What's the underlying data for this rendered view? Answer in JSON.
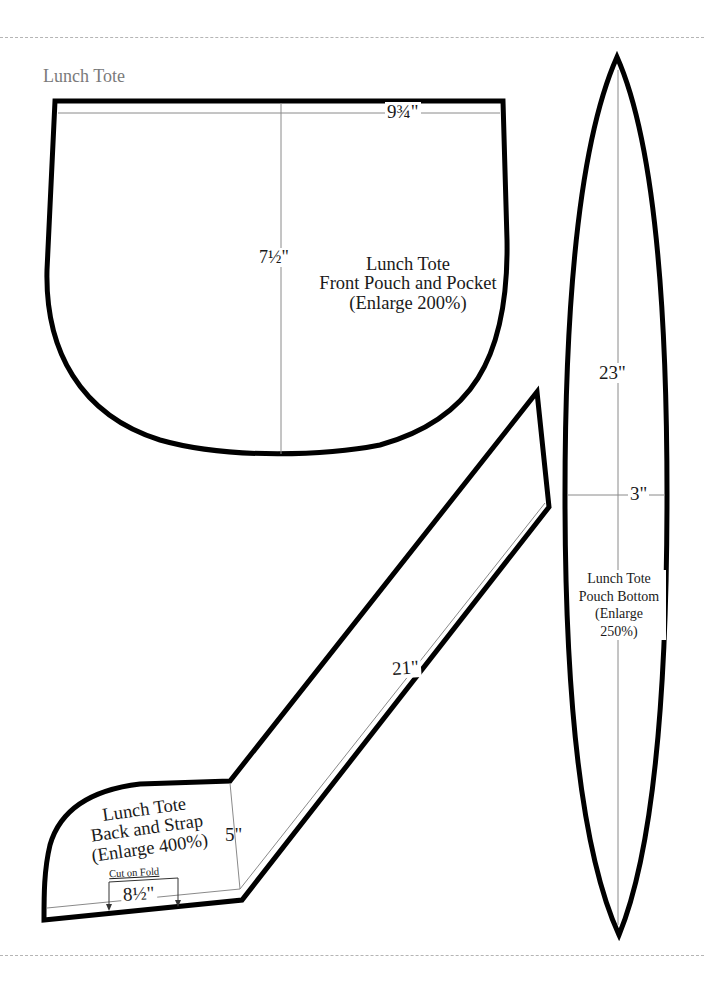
{
  "page": {
    "title": "Lunch Tote",
    "cut_line_color": "#b5b5b5",
    "outline_color": "#000000",
    "guide_line_color": "#8a8a8a"
  },
  "pieces": {
    "front_pouch": {
      "name_line1": "Lunch Tote",
      "name_line2": "Front Pouch and Pocket",
      "enlarge": "(Enlarge 200%)",
      "width_dim": "9¾\"",
      "height_dim": "7½\""
    },
    "back_strap": {
      "name_line1": "Lunch Tote",
      "name_line2": "Back and Strap",
      "enlarge": "(Enlarge 400%)",
      "fold_label": "Cut on Fold",
      "base_dim": "8½\"",
      "side_dim": "5\"",
      "strap_dim": "21\""
    },
    "pouch_bottom": {
      "name_line1": "Lunch Tote",
      "name_line2": "Pouch Bottom",
      "enlarge_line1": "(Enlarge",
      "enlarge_line2": "250%)",
      "length_dim": "23\"",
      "half_width_dim": "3\""
    }
  }
}
